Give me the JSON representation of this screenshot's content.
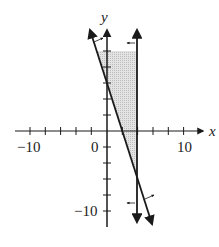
{
  "graph": {
    "x_axis_label": "x",
    "y_axis_label": "y",
    "x_tick_labels": [
      {
        "value": -10,
        "text": "−10"
      },
      {
        "value": 0,
        "text": "0"
      },
      {
        "value": 10,
        "text": "10"
      }
    ],
    "y_tick_labels": [
      {
        "value": -10,
        "text": "−10"
      }
    ],
    "tick_step": 2,
    "x_range": [
      -12,
      12
    ],
    "y_range": [
      -12,
      12
    ],
    "inequalities": [
      {
        "boundary": "y = -3x + 6",
        "shade": "above / right",
        "form": "3x + y ≥ 6"
      },
      {
        "boundary": "x = 4",
        "shade": "left",
        "form": "x ≤ 4"
      }
    ],
    "shaded_region_color": "#d9d9d9",
    "line_color": "#1a1a1a"
  }
}
